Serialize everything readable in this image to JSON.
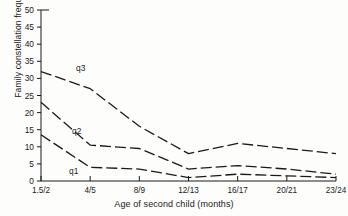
{
  "chart_data": {
    "type": "line",
    "title": "",
    "xlabel": "Age of second child (months)",
    "ylabel": "Family constellation frequencies",
    "categories": [
      "1.5/2",
      "4/5",
      "8/9",
      "12/13",
      "16/17",
      "20/21",
      "23/24"
    ],
    "ylim": [
      0,
      50
    ],
    "yticks": [
      0,
      5,
      10,
      15,
      20,
      25,
      30,
      35,
      40,
      45,
      50
    ],
    "grid": false,
    "legend_position": "inline-labels",
    "line_style": "dashed",
    "color": "#1a1a1a",
    "series": [
      {
        "name": "q3",
        "values": [
          32,
          27,
          16,
          8,
          11,
          9.5,
          8
        ]
      },
      {
        "name": "q2",
        "values": [
          23,
          10.5,
          9.5,
          3.5,
          4.5,
          3.5,
          2
        ]
      },
      {
        "name": "q1",
        "values": [
          13.5,
          4,
          3.5,
          1,
          2,
          1.5,
          1
        ]
      }
    ],
    "annotations": [
      {
        "text": "q3",
        "series": "q3",
        "x_px": 76,
        "y_px": 71
      },
      {
        "text": "q2",
        "series": "q2",
        "x_px": 72,
        "y_px": 134
      },
      {
        "text": "q1",
        "series": "q1",
        "x_px": 69,
        "y_px": 174
      }
    ]
  },
  "axes": {
    "y_tick_labels": [
      "50",
      "45",
      "40",
      "35",
      "30",
      "25",
      "20",
      "15",
      "10",
      "5",
      "0"
    ],
    "x_tick_labels": [
      "1.5/2",
      "4/5",
      "8/9",
      "12/13",
      "16/17",
      "20/21",
      "23/24"
    ]
  }
}
